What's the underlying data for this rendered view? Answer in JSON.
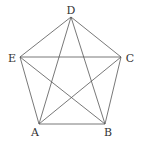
{
  "diagram": {
    "title": "",
    "type": "complete graph on pentagon",
    "stroke_color": "#555555",
    "label_color": "#333333",
    "vertices": {
      "D": {
        "label": "D",
        "x": 71,
        "y": 17,
        "lx": 71,
        "ly": 14
      },
      "E": {
        "label": "E",
        "x": 20,
        "y": 57,
        "lx": 12,
        "ly": 62
      },
      "C": {
        "label": "C",
        "x": 121,
        "y": 57,
        "lx": 130,
        "ly": 62
      },
      "A": {
        "label": "A",
        "x": 39,
        "y": 124,
        "lx": 35,
        "ly": 136
      },
      "B": {
        "label": "B",
        "x": 105,
        "y": 124,
        "lx": 108,
        "ly": 136
      }
    },
    "edges": [
      [
        "D",
        "E"
      ],
      [
        "D",
        "C"
      ],
      [
        "E",
        "A"
      ],
      [
        "C",
        "B"
      ],
      [
        "A",
        "B"
      ],
      [
        "D",
        "A"
      ],
      [
        "D",
        "B"
      ],
      [
        "E",
        "C"
      ],
      [
        "E",
        "B"
      ],
      [
        "C",
        "A"
      ]
    ]
  }
}
